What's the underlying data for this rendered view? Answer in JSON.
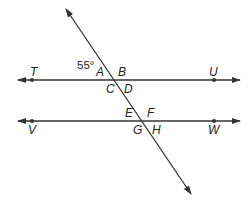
{
  "diagram": {
    "type": "parallel-lines-cut-by-transversal",
    "colors": {
      "line": "#333333",
      "text": "#222222",
      "background": "#ffffff"
    },
    "lines": [
      {
        "id": "TU",
        "x1": 18,
        "y1": 80,
        "x2": 240,
        "y2": 80,
        "arrows": "both"
      },
      {
        "id": "VW",
        "x1": 18,
        "y1": 121,
        "x2": 240,
        "y2": 121,
        "arrows": "both"
      },
      {
        "id": "transversal",
        "x1": 66,
        "y1": 9,
        "x2": 191,
        "y2": 194,
        "arrows": "both"
      }
    ],
    "points": [
      {
        "label": "T",
        "x": 32,
        "y": 80,
        "label_x": 30,
        "label_y": 76
      },
      {
        "label": "U",
        "x": 214,
        "y": 80,
        "label_x": 209,
        "label_y": 76
      },
      {
        "label": "V",
        "x": 32,
        "y": 121,
        "label_x": 28,
        "label_y": 134
      },
      {
        "label": "W",
        "x": 214,
        "y": 121,
        "label_x": 208,
        "label_y": 134
      }
    ],
    "angle_labels": [
      {
        "label": "A",
        "x": 96,
        "y": 76
      },
      {
        "label": "B",
        "x": 118,
        "y": 76
      },
      {
        "label": "C",
        "x": 106,
        "y": 93
      },
      {
        "label": "D",
        "x": 124,
        "y": 93
      },
      {
        "label": "E",
        "x": 125,
        "y": 117
      },
      {
        "label": "F",
        "x": 147,
        "y": 117
      },
      {
        "label": "G",
        "x": 133,
        "y": 134
      },
      {
        "label": "H",
        "x": 152,
        "y": 134
      }
    ],
    "given_angle": {
      "text": "55°",
      "x": 77,
      "y": 69,
      "applies_to": "A"
    }
  }
}
